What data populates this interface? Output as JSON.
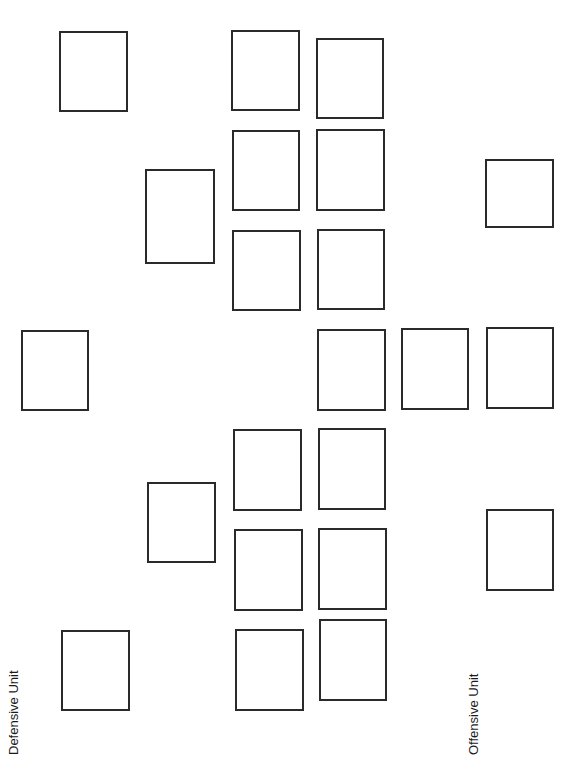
{
  "labels": {
    "defensive": "Defensive Unit",
    "offensive": "Offensive Unit"
  },
  "colors": {
    "stroke": "#2a2a2a",
    "background": "#ffffff",
    "text": "#1a1a1a"
  },
  "slots": [
    {
      "id": "d-col1-top",
      "group": "defensive",
      "x": 59,
      "y": 31,
      "w": 69,
      "h": 81
    },
    {
      "id": "d-col1-mid",
      "group": "defensive",
      "x": 21,
      "y": 330,
      "w": 68,
      "h": 81
    },
    {
      "id": "d-col1-bot",
      "group": "defensive",
      "x": 61,
      "y": 630,
      "w": 69,
      "h": 81
    },
    {
      "id": "d-col2-top",
      "group": "defensive",
      "x": 145,
      "y": 169,
      "w": 70,
      "h": 95
    },
    {
      "id": "d-col2-bot",
      "group": "defensive",
      "x": 147,
      "y": 482,
      "w": 69,
      "h": 81
    },
    {
      "id": "d-col3-r1",
      "group": "defensive",
      "x": 231,
      "y": 30,
      "w": 69,
      "h": 81
    },
    {
      "id": "d-col3-r2",
      "group": "defensive",
      "x": 232,
      "y": 130,
      "w": 68,
      "h": 81
    },
    {
      "id": "d-col3-r3",
      "group": "defensive",
      "x": 232,
      "y": 230,
      "w": 69,
      "h": 81
    },
    {
      "id": "d-col3-r4",
      "group": "defensive",
      "x": 233,
      "y": 429,
      "w": 69,
      "h": 82
    },
    {
      "id": "d-col3-r5",
      "group": "defensive",
      "x": 234,
      "y": 529,
      "w": 69,
      "h": 82
    },
    {
      "id": "d-col3-r6",
      "group": "defensive",
      "x": 235,
      "y": 629,
      "w": 69,
      "h": 82
    },
    {
      "id": "o-col1-r1",
      "group": "offensive",
      "x": 316,
      "y": 38,
      "w": 68,
      "h": 81
    },
    {
      "id": "o-col1-r2",
      "group": "offensive",
      "x": 316,
      "y": 129,
      "w": 69,
      "h": 82
    },
    {
      "id": "o-col1-r3",
      "group": "offensive",
      "x": 317,
      "y": 229,
      "w": 68,
      "h": 81
    },
    {
      "id": "o-col1-r4",
      "group": "offensive",
      "x": 317,
      "y": 329,
      "w": 69,
      "h": 82
    },
    {
      "id": "o-col1-r5",
      "group": "offensive",
      "x": 318,
      "y": 428,
      "w": 68,
      "h": 82
    },
    {
      "id": "o-col1-r6",
      "group": "offensive",
      "x": 318,
      "y": 528,
      "w": 69,
      "h": 82
    },
    {
      "id": "o-col1-r7",
      "group": "offensive",
      "x": 319,
      "y": 619,
      "w": 68,
      "h": 82
    },
    {
      "id": "o-col2-mid",
      "group": "offensive",
      "x": 401,
      "y": 328,
      "w": 68,
      "h": 82
    },
    {
      "id": "o-col3-top",
      "group": "offensive",
      "x": 485,
      "y": 159,
      "w": 69,
      "h": 69
    },
    {
      "id": "o-col3-mid",
      "group": "offensive",
      "x": 486,
      "y": 327,
      "w": 68,
      "h": 82
    },
    {
      "id": "o-col3-bot",
      "group": "offensive",
      "x": 486,
      "y": 509,
      "w": 68,
      "h": 82
    }
  ]
}
